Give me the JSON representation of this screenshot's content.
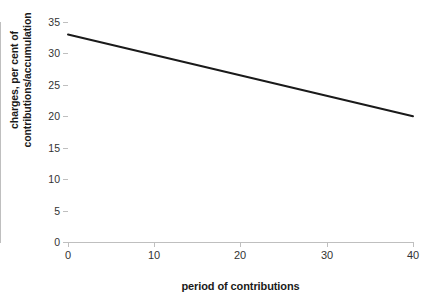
{
  "chart_data": {
    "type": "line",
    "title": "",
    "xlabel": "period of contributions",
    "ylabel": "charges, per cent of contributions/accumulation",
    "ylabel_line1": "charges, per cent of",
    "ylabel_line2": "contributions/accumulation",
    "xlim": [
      0,
      40
    ],
    "ylim": [
      0,
      35
    ],
    "xticks": [
      0,
      10,
      20,
      30,
      40
    ],
    "yticks": [
      0,
      5,
      10,
      15,
      20,
      25,
      30,
      35
    ],
    "xtick_labels": [
      "0",
      "10",
      "20",
      "30",
      "40"
    ],
    "ytick_labels": [
      "0",
      "5",
      "10",
      "15",
      "20",
      "25",
      "30",
      "35"
    ],
    "grid": false,
    "legend": false,
    "legend_position": "none",
    "series": [
      {
        "name": "charges",
        "color": "#1a1a1a",
        "line_width": 2,
        "x": [
          0,
          40
        ],
        "values": [
          33.0,
          20.0
        ]
      }
    ],
    "annotations": []
  },
  "colors": {
    "background": "#ffffff",
    "axis": "#bfbfbf",
    "tick_text": "#333333",
    "axis_title": "#1a1a1a",
    "series_line": "#1a1a1a"
  }
}
